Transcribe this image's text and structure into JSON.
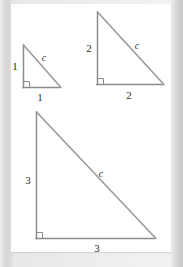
{
  "figure": {
    "page_background": "#ffffff",
    "margin_background": "#d9d9d9",
    "line_color": "#8c8c8c",
    "text_color": "#2b2b2b",
    "triangles": [
      {
        "id": "triangle-small",
        "name": "small-right-triangle",
        "vertical_leg_label": "1",
        "horizontal_leg_label": "1",
        "hypotenuse_label": "c",
        "right_angle_marker": true,
        "apex": [
          23,
          45
        ],
        "right_angle_vertex": [
          23,
          87
        ],
        "far_vertex": [
          60,
          87
        ]
      },
      {
        "id": "triangle-medium",
        "name": "medium-right-triangle",
        "vertical_leg_label": "2",
        "horizontal_leg_label": "2",
        "hypotenuse_label": "c",
        "right_angle_marker": true,
        "apex": [
          97,
          12
        ],
        "right_angle_vertex": [
          97,
          84
        ],
        "far_vertex": [
          163,
          84
        ]
      },
      {
        "id": "triangle-large",
        "name": "large-right-triangle",
        "vertical_leg_label": "3",
        "horizontal_leg_label": "3",
        "hypotenuse_label": "c",
        "right_angle_marker": true,
        "apex": [
          36,
          112
        ],
        "right_angle_vertex": [
          36,
          238
        ],
        "far_vertex": [
          155,
          238
        ]
      }
    ],
    "labels": {
      "small_vertical": {
        "text": "1",
        "x": 15,
        "y": 70
      },
      "small_horizontal": {
        "text": "1",
        "x": 39,
        "y": 100
      },
      "small_hypotenuse": {
        "text": "c",
        "x": 43,
        "y": 60
      },
      "medium_vertical": {
        "text": "2",
        "x": 88,
        "y": 51
      },
      "medium_horizontal": {
        "text": "2",
        "x": 127,
        "y": 98
      },
      "medium_hypotenuse": {
        "text": "c",
        "x": 136,
        "y": 48
      },
      "large_vertical": {
        "text": "3",
        "x": 27,
        "y": 180
      },
      "large_horizontal": {
        "text": "3",
        "x": 96,
        "y": 252
      },
      "large_hypotenuse": {
        "text": "c",
        "x": 100,
        "y": 176
      }
    }
  }
}
